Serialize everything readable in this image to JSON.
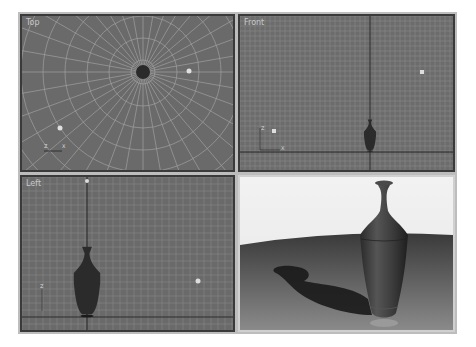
{
  "viewports": {
    "top": {
      "label": "Top",
      "axis_x": "X",
      "axis_y": "Z"
    },
    "front": {
      "label": "Front",
      "axis_x": "X",
      "axis_y": "Z"
    },
    "left": {
      "label": "Left",
      "axis_y": "Z"
    },
    "perspective": {
      "label": ""
    }
  },
  "colors": {
    "viewport_bg": "#6a6a6a",
    "grid_line": "#8c8c8c",
    "grid_major": "#1e1e1e",
    "object": "#2b2b2b",
    "render_bg": "#eeeeee"
  }
}
